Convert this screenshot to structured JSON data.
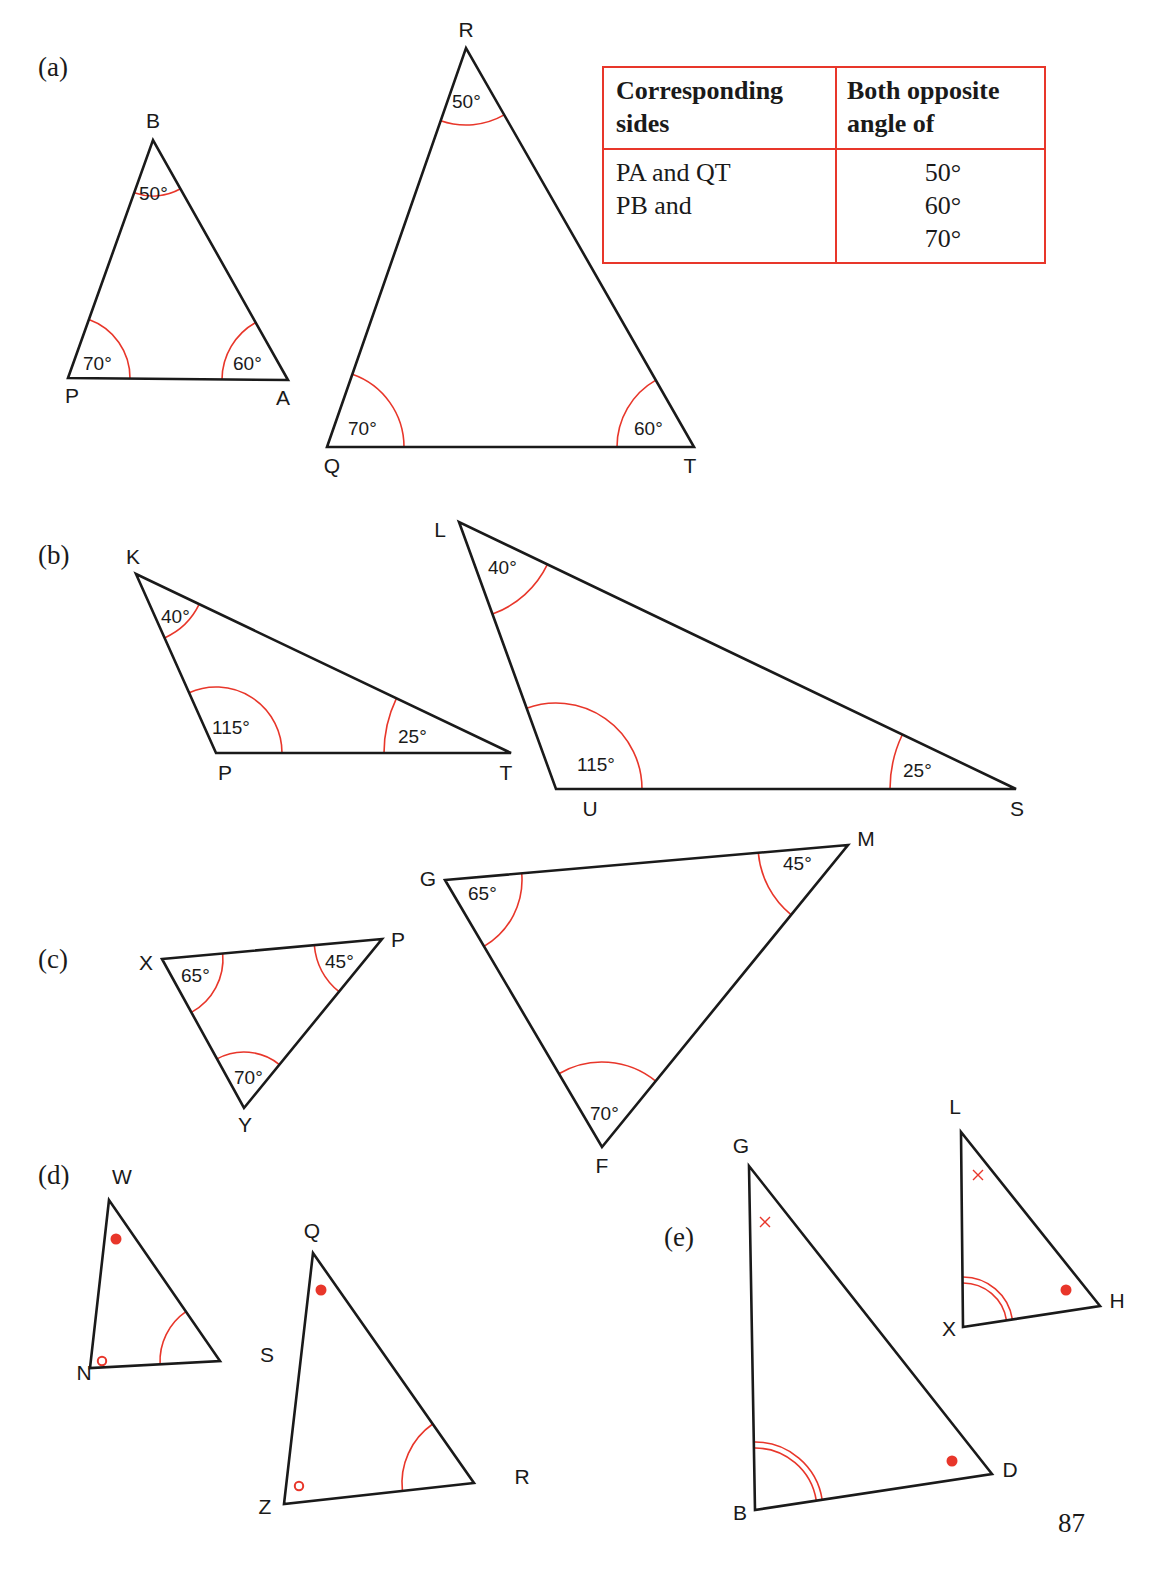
{
  "page": {
    "number": "87"
  },
  "colors": {
    "ink": "#1a1a1a",
    "accent": "#e8362a"
  },
  "parts": [
    {
      "id": "a",
      "label": "(a)",
      "x": 38,
      "y": 52
    },
    {
      "id": "b",
      "label": "(b)",
      "x": 38,
      "y": 540
    },
    {
      "id": "c",
      "label": "(c)",
      "x": 38,
      "y": 944
    },
    {
      "id": "d",
      "label": "(d)",
      "x": 38,
      "y": 1160
    },
    {
      "id": "e",
      "label": "(e)",
      "x": 664,
      "y": 1222
    }
  ],
  "table": {
    "headers": {
      "col1": "Corresponding sides",
      "col2": "Both opposite angle of"
    },
    "header_lines": {
      "col1": [
        "Corresponding",
        "sides"
      ],
      "col2": [
        "Both opposite",
        "angle of"
      ]
    },
    "rows": [
      {
        "sides": "PA and QT",
        "angle": "50°"
      },
      {
        "sides": "PB and",
        "angle": "60°"
      },
      {
        "sides": "",
        "angle": "70°"
      }
    ]
  },
  "triangles": [
    {
      "id": "PBA",
      "part": "a",
      "vertices": [
        {
          "name": "P",
          "x": 68,
          "y": 378,
          "lx": 72,
          "ly": 403
        },
        {
          "name": "B",
          "x": 153,
          "y": 140,
          "lx": 153,
          "ly": 128
        },
        {
          "name": "A",
          "x": 288,
          "y": 380,
          "lx": 283,
          "ly": 405
        }
      ],
      "angles": [
        {
          "at": 0,
          "value": "70°",
          "r": 62,
          "marker": "arc",
          "tx": 83,
          "ty": 370
        },
        {
          "at": 1,
          "value": "50°",
          "r": 56,
          "marker": "arc",
          "tx": 139,
          "ty": 200
        },
        {
          "at": 2,
          "value": "60°",
          "r": 66,
          "marker": "arc",
          "tx": 233,
          "ty": 370
        }
      ]
    },
    {
      "id": "QRT",
      "part": "a",
      "vertices": [
        {
          "name": "Q",
          "x": 327,
          "y": 447,
          "lx": 332,
          "ly": 473
        },
        {
          "name": "R",
          "x": 466,
          "y": 48,
          "lx": 466,
          "ly": 37
        },
        {
          "name": "T",
          "x": 694,
          "y": 447,
          "lx": 690,
          "ly": 473
        }
      ],
      "angles": [
        {
          "at": 0,
          "value": "70°",
          "r": 77,
          "marker": "arc",
          "tx": 348,
          "ty": 435
        },
        {
          "at": 1,
          "value": "50°",
          "r": 77,
          "marker": "arc",
          "tx": 452,
          "ty": 108
        },
        {
          "at": 2,
          "value": "60°",
          "r": 77,
          "marker": "arc",
          "tx": 634,
          "ty": 435
        }
      ]
    },
    {
      "id": "KPT",
      "part": "b",
      "vertices": [
        {
          "name": "K",
          "x": 136,
          "y": 574,
          "lx": 133,
          "ly": 564
        },
        {
          "name": "P",
          "x": 216,
          "y": 753,
          "lx": 225,
          "ly": 780
        },
        {
          "name": "T",
          "x": 511,
          "y": 753,
          "lx": 506,
          "ly": 780
        }
      ],
      "angles": [
        {
          "at": 0,
          "value": "40°",
          "r": 70,
          "marker": "arc",
          "tx": 161,
          "ty": 623
        },
        {
          "at": 1,
          "value": "115°",
          "r": 66,
          "marker": "arc",
          "tx": 212,
          "ty": 734
        },
        {
          "at": 2,
          "value": "25°",
          "r": 127,
          "marker": "arc",
          "tx": 398,
          "ty": 743
        }
      ]
    },
    {
      "id": "LUS",
      "part": "b",
      "vertices": [
        {
          "name": "L",
          "x": 459,
          "y": 522,
          "lx": 440,
          "ly": 537
        },
        {
          "name": "U",
          "x": 556,
          "y": 789,
          "lx": 590,
          "ly": 816
        },
        {
          "name": "S",
          "x": 1016,
          "y": 789,
          "lx": 1017,
          "ly": 816
        }
      ],
      "angles": [
        {
          "at": 0,
          "value": "40°",
          "r": 98,
          "marker": "arc",
          "tx": 488,
          "ty": 574
        },
        {
          "at": 1,
          "value": "115°",
          "r": 86,
          "marker": "arc",
          "tx": 577,
          "ty": 771
        },
        {
          "at": 2,
          "value": "25°",
          "r": 126,
          "marker": "arc",
          "tx": 903,
          "ty": 777
        }
      ]
    },
    {
      "id": "XPY",
      "part": "c",
      "vertices": [
        {
          "name": "X",
          "x": 162,
          "y": 959,
          "lx": 146,
          "ly": 970
        },
        {
          "name": "P",
          "x": 382,
          "y": 939,
          "lx": 398,
          "ly": 947
        },
        {
          "name": "Y",
          "x": 244,
          "y": 1108,
          "lx": 245,
          "ly": 1132
        }
      ],
      "angles": [
        {
          "at": 0,
          "value": "65°",
          "r": 61,
          "marker": "arc",
          "tx": 181,
          "ty": 982
        },
        {
          "at": 1,
          "value": "45°",
          "r": 68,
          "marker": "arc",
          "tx": 325,
          "ty": 968
        },
        {
          "at": 2,
          "value": "70°",
          "r": 56,
          "marker": "arc",
          "tx": 234,
          "ty": 1084
        }
      ]
    },
    {
      "id": "GMF",
      "part": "c",
      "vertices": [
        {
          "name": "G",
          "x": 445,
          "y": 880,
          "lx": 428,
          "ly": 886
        },
        {
          "name": "M",
          "x": 848,
          "y": 845,
          "lx": 866,
          "ly": 846
        },
        {
          "name": "F",
          "x": 602,
          "y": 1147,
          "lx": 602,
          "ly": 1173
        }
      ],
      "angles": [
        {
          "at": 0,
          "value": "65°",
          "r": 77,
          "marker": "arc",
          "tx": 468,
          "ty": 900
        },
        {
          "at": 1,
          "value": "45°",
          "r": 90,
          "marker": "arc",
          "tx": 783,
          "ty": 870
        },
        {
          "at": 2,
          "value": "70°",
          "r": 85,
          "marker": "arc",
          "tx": 590,
          "ty": 1120
        }
      ]
    },
    {
      "id": "WNS",
      "part": "d",
      "vertices": [
        {
          "name": "W",
          "x": 109,
          "y": 1200,
          "lx": 122,
          "ly": 1184
        },
        {
          "name": "N",
          "x": 90,
          "y": 1368,
          "lx": 84,
          "ly": 1380
        },
        {
          "name": "S",
          "x": 220,
          "y": 1361,
          "lx": 267,
          "ly": 1362
        }
      ],
      "angles": [
        {
          "at": 0,
          "value": "",
          "marker": "dot",
          "mx": 116,
          "my": 1239
        },
        {
          "at": 1,
          "value": "",
          "marker": "circle",
          "mx": 102,
          "my": 1361
        },
        {
          "at": 2,
          "value": "",
          "r": 60,
          "marker": "arc"
        }
      ]
    },
    {
      "id": "QZR",
      "part": "d",
      "vertices": [
        {
          "name": "Q",
          "x": 313,
          "y": 1253,
          "lx": 312,
          "ly": 1238
        },
        {
          "name": "Z",
          "x": 284,
          "y": 1504,
          "lx": 265,
          "ly": 1514
        },
        {
          "name": "R",
          "x": 474,
          "y": 1483,
          "lx": 522,
          "ly": 1484
        }
      ],
      "angles": [
        {
          "at": 0,
          "value": "",
          "marker": "dot",
          "mx": 321,
          "my": 1290
        },
        {
          "at": 1,
          "value": "",
          "marker": "circle",
          "mx": 299,
          "my": 1486
        },
        {
          "at": 2,
          "value": "",
          "r": 72,
          "marker": "arc"
        }
      ]
    },
    {
      "id": "GBD",
      "part": "e",
      "vertices": [
        {
          "name": "G",
          "x": 749,
          "y": 1166,
          "lx": 741,
          "ly": 1153
        },
        {
          "name": "B",
          "x": 755,
          "y": 1510,
          "lx": 740,
          "ly": 1520
        },
        {
          "name": "D",
          "x": 992,
          "y": 1474,
          "lx": 1010,
          "ly": 1477
        }
      ],
      "angles": [
        {
          "at": 0,
          "value": "",
          "marker": "cross",
          "mx": 765,
          "my": 1222
        },
        {
          "at": 1,
          "value": "",
          "r": 62,
          "marker": "double-arc"
        },
        {
          "at": 2,
          "value": "",
          "marker": "dot",
          "mx": 952,
          "my": 1461
        }
      ]
    },
    {
      "id": "LXH",
      "part": "e",
      "vertices": [
        {
          "name": "L",
          "x": 961,
          "y": 1132,
          "lx": 955,
          "ly": 1114
        },
        {
          "name": "X",
          "x": 963,
          "y": 1327,
          "lx": 949,
          "ly": 1336
        },
        {
          "name": "H",
          "x": 1100,
          "y": 1306,
          "lx": 1117,
          "ly": 1308
        }
      ],
      "angles": [
        {
          "at": 0,
          "value": "",
          "marker": "cross",
          "mx": 978,
          "my": 1175
        },
        {
          "at": 1,
          "value": "",
          "r": 44,
          "marker": "double-arc"
        },
        {
          "at": 2,
          "value": "",
          "marker": "dot",
          "mx": 1066,
          "my": 1290
        }
      ]
    }
  ]
}
